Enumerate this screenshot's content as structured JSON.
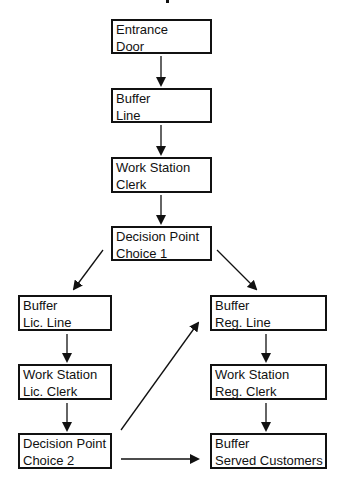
{
  "diagram": {
    "type": "flowchart",
    "colors": {
      "stroke": "#111111",
      "background": "#ffffff"
    },
    "nodes": [
      {
        "id": "entrance",
        "line1": "Entrance",
        "line2": "Door"
      },
      {
        "id": "buffer_line",
        "line1": "Buffer",
        "line2": "Line"
      },
      {
        "id": "ws_clerk",
        "line1": "Work Station",
        "line2": "Clerk"
      },
      {
        "id": "dp_choice1",
        "line1": "Decision Point",
        "line2": "Choice 1"
      },
      {
        "id": "buffer_lic_line",
        "line1": "Buffer",
        "line2": "Lic. Line"
      },
      {
        "id": "ws_lic_clerk",
        "line1": "Work Station",
        "line2": "Lic. Clerk"
      },
      {
        "id": "dp_choice2",
        "line1": "Decision Point",
        "line2": "Choice 2"
      },
      {
        "id": "buffer_reg_line",
        "line1": "Buffer",
        "line2": "Reg. Line"
      },
      {
        "id": "ws_reg_clerk",
        "line1": "Work Station",
        "line2": "Reg. Clerk"
      },
      {
        "id": "buffer_served",
        "line1": "Buffer",
        "line2": "Served Customers"
      }
    ],
    "edges": [
      {
        "from": "entrance",
        "to": "buffer_line"
      },
      {
        "from": "buffer_line",
        "to": "ws_clerk"
      },
      {
        "from": "ws_clerk",
        "to": "dp_choice1"
      },
      {
        "from": "dp_choice1",
        "to": "buffer_lic_line"
      },
      {
        "from": "dp_choice1",
        "to": "buffer_reg_line"
      },
      {
        "from": "buffer_lic_line",
        "to": "ws_lic_clerk"
      },
      {
        "from": "ws_lic_clerk",
        "to": "dp_choice2"
      },
      {
        "from": "dp_choice2",
        "to": "buffer_reg_line"
      },
      {
        "from": "dp_choice2",
        "to": "buffer_served"
      },
      {
        "from": "buffer_reg_line",
        "to": "ws_reg_clerk"
      },
      {
        "from": "ws_reg_clerk",
        "to": "buffer_served"
      }
    ]
  }
}
